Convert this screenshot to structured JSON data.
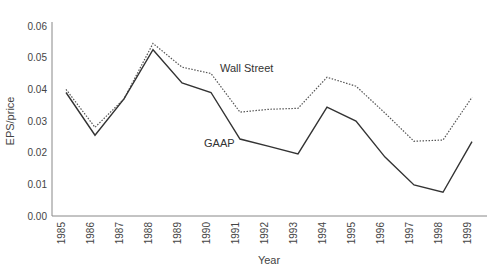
{
  "chart_data": {
    "type": "line",
    "title": "",
    "xlabel": "Year",
    "ylabel": "EPS/price",
    "x": [
      1985,
      1986,
      1987,
      1988,
      1989,
      1990,
      1991,
      1992,
      1993,
      1994,
      1995,
      1996,
      1997,
      1998,
      1999
    ],
    "x_tick_labels": [
      "1985",
      "1986",
      "1987",
      "1988",
      "1989",
      "1990",
      "1991",
      "1992",
      "1993",
      "1994",
      "1995",
      "1996",
      "1997",
      "1998",
      "1999"
    ],
    "ylim": [
      0,
      0.06
    ],
    "y_ticks": [
      0,
      0.01,
      0.02,
      0.03,
      0.04,
      0.05,
      0.06
    ],
    "y_tick_labels": [
      "0.00",
      "0.01",
      "0.02",
      "0.03",
      "0.04",
      "0.05",
      "0.06"
    ],
    "grid": false,
    "legend": "inline labels",
    "series": [
      {
        "name": "Wall Street",
        "style": "dotted",
        "color": "#555555",
        "values": [
          0.04,
          0.028,
          0.037,
          0.0545,
          0.047,
          0.045,
          0.0328,
          0.0337,
          0.034,
          0.0438,
          0.041,
          0.0325,
          0.0236,
          0.024,
          0.0375
        ]
      },
      {
        "name": "GAAP",
        "style": "solid",
        "color": "#333333",
        "values": [
          0.039,
          0.0255,
          0.037,
          0.0525,
          0.042,
          0.039,
          0.0243,
          0.022,
          0.0196,
          0.0344,
          0.03,
          0.0186,
          0.0098,
          0.0075,
          0.0235
        ]
      }
    ],
    "annotations": [
      "Wall Street",
      "GAAP"
    ]
  }
}
